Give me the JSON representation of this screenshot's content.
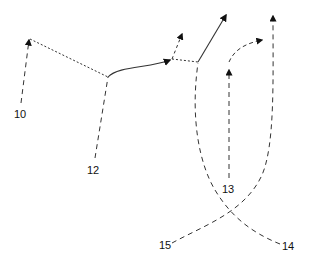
{
  "diagram": {
    "labels": [
      {
        "id": "10",
        "text": "10",
        "x": 14,
        "y": 109
      },
      {
        "id": "12",
        "text": "12",
        "x": 87,
        "y": 165
      },
      {
        "id": "13",
        "text": "13",
        "x": 222,
        "y": 184
      },
      {
        "id": "14",
        "text": "14",
        "x": 282,
        "y": 241
      },
      {
        "id": "15",
        "text": "15",
        "x": 159,
        "y": 240
      }
    ],
    "line_color": "#222222"
  }
}
